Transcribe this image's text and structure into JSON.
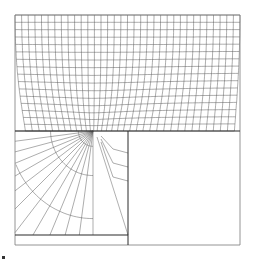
{
  "diagram": {
    "type": "finite-element-mesh",
    "colors": {
      "background": "#ffffff",
      "mesh_line": "#5a5a5a",
      "boundary_line": "#7a7a7a",
      "thick_line": "#2a2a2a"
    },
    "frame": {
      "left": 15,
      "top": 15,
      "right": 240,
      "bottom": 245
    },
    "divider_y": 131,
    "divider_x": 128,
    "singularity": {
      "x": 93,
      "y": 131
    },
    "inner_bottom_y": 235,
    "upper_region": {
      "cols": 34,
      "rows": 16
    },
    "lower_left_region": {
      "radial_lines": 12,
      "rings": 7
    },
    "lower_right_region": "empty"
  }
}
